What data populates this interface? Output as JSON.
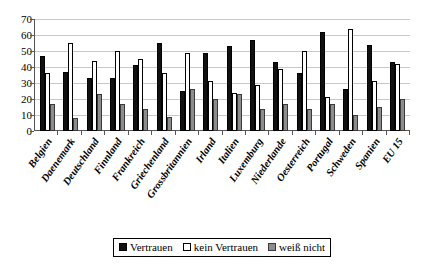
{
  "chart_data": {
    "type": "bar",
    "title": "",
    "subtitle": "",
    "xlabel": "",
    "ylabel": "",
    "ylim": [
      0,
      70
    ],
    "yticks": [
      0,
      10,
      20,
      30,
      40,
      50,
      60,
      70
    ],
    "grid": true,
    "legend_position": "bottom",
    "categories": [
      "Belgien",
      "Daenemark",
      "Deutschland",
      "Finnland",
      "Frankreich",
      "Griechenland",
      "Grossbritannien",
      "Irland",
      "Italien",
      "Luxemburg",
      "Niederlande",
      "Oesterreich",
      "Portugal",
      "Schweden",
      "Spanien",
      "EU 15"
    ],
    "series": [
      {
        "name": "Vertrauen",
        "color": "#111111",
        "values": [
          47,
          37,
          33,
          33,
          41,
          55,
          25,
          49,
          53,
          57,
          43,
          36,
          62,
          26,
          54,
          43
        ]
      },
      {
        "name": "kein Vertrauen",
        "color": "#ffffff",
        "values": [
          36,
          55,
          44,
          50,
          45,
          36,
          49,
          31,
          24,
          29,
          39,
          50,
          21,
          64,
          31,
          42
        ]
      },
      {
        "name": "weiß nicht",
        "color": "#8d8d8d",
        "values": [
          17,
          8,
          23,
          17,
          14,
          9,
          26,
          20,
          23,
          14,
          17,
          14,
          17,
          10,
          15,
          20
        ]
      }
    ]
  },
  "legend": {
    "items": [
      {
        "label": "Vertrauen",
        "swatch": "black-square-swatch"
      },
      {
        "label": "kein Vertrauen",
        "swatch": "white-square-swatch"
      },
      {
        "label": "weiß nicht",
        "swatch": "gray-square-swatch"
      }
    ]
  }
}
